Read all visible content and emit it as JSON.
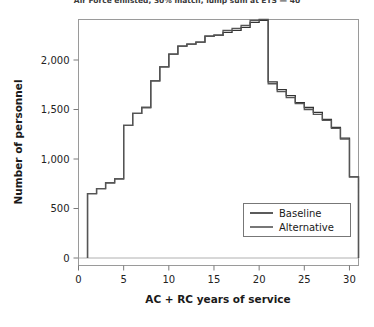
{
  "chart_data": {
    "type": "line",
    "title": "Air Force enlisted, 30% match, lump sum at ETS — 40",
    "xlabel": "AC + RC years of service",
    "ylabel": "Number of personnel",
    "xlim": [
      0,
      31
    ],
    "ylim": [
      0,
      2450
    ],
    "xticks": [
      0,
      5,
      10,
      15,
      20,
      25,
      30
    ],
    "xtick_labels": [
      "0",
      "5",
      "10",
      "15",
      "20",
      "25",
      "30"
    ],
    "yticks": [
      0,
      500,
      1000,
      1500,
      2000
    ],
    "ytick_labels": [
      "0",
      "500",
      "1,000",
      "1,500",
      "2,000"
    ],
    "grid": false,
    "drawstyle": "steps-post",
    "legend_position": "lower right",
    "x": [
      1,
      2,
      3,
      4,
      5,
      6,
      7,
      8,
      9,
      10,
      11,
      12,
      13,
      14,
      15,
      16,
      17,
      18,
      19,
      20,
      21,
      22,
      23,
      24,
      25,
      26,
      27,
      28,
      29,
      30
    ],
    "series": [
      {
        "name": "Baseline",
        "color": "#333333",
        "values": [
          650,
          700,
          760,
          800,
          1340,
          1460,
          1520,
          1790,
          1930,
          2060,
          2140,
          2160,
          2180,
          2240,
          2250,
          2280,
          2300,
          2330,
          2380,
          2400,
          1780,
          1700,
          1640,
          1570,
          1520,
          1470,
          1400,
          1320,
          1210,
          820
        ]
      },
      {
        "name": "Alternative",
        "color": "#555555",
        "values": [
          650,
          700,
          760,
          800,
          1340,
          1460,
          1520,
          1790,
          1930,
          2060,
          2140,
          2160,
          2180,
          2240,
          2250,
          2300,
          2320,
          2350,
          2400,
          2410,
          1760,
          1680,
          1620,
          1560,
          1500,
          1450,
          1390,
          1310,
          1200,
          820
        ]
      }
    ]
  },
  "legend": {
    "items": [
      {
        "label": "Baseline"
      },
      {
        "label": "Alternative"
      }
    ]
  }
}
